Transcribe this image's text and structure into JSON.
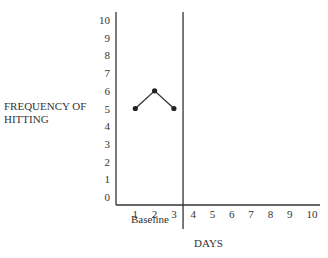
{
  "chart_data": {
    "type": "line",
    "title": "",
    "xlabel": "DAYS",
    "ylabel": "FREQUENCY OF HITTING",
    "ylabel_lines": [
      "FREQUENCY OF",
      "HITTING"
    ],
    "x_ticks": [
      1,
      2,
      3,
      4,
      5,
      6,
      7,
      8,
      9,
      10
    ],
    "y_ticks": [
      0,
      1,
      2,
      3,
      4,
      5,
      6,
      7,
      8,
      9,
      10
    ],
    "xlim": [
      0,
      10
    ],
    "ylim": [
      0,
      10
    ],
    "grid": false,
    "phase_line_after_x": 3.5,
    "phase_label": "Baseline",
    "series": [
      {
        "name": "Baseline",
        "x": [
          1,
          2,
          3
        ],
        "values": [
          5,
          6,
          5
        ]
      }
    ]
  }
}
